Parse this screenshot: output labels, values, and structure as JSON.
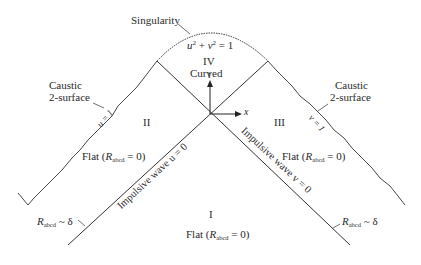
{
  "diagram": {
    "labels": {
      "singularity": "Singularity",
      "equation_u": "u",
      "equation_plus": " + ",
      "equation_v": "v",
      "equation_rest": " = 1",
      "region_iv": "IV",
      "region_iv_desc": "Curved",
      "axis_t": "t",
      "axis_x": "x",
      "caustic_left_1": "Caustic",
      "caustic_left_2": "2-surface",
      "caustic_right_1": "Caustic",
      "caustic_right_2": "2-surface",
      "u_eq_1": "u = 1",
      "v_eq_1": "v = 1",
      "region_ii": "II",
      "region_iii": "III",
      "region_i": "I",
      "flat_prefix": "Flat (",
      "flat_R": "R",
      "flat_sub": "abcd",
      "flat_suffix": " = 0)",
      "impulsive_u": "Impulsive wave u = 0",
      "impulsive_v": "Impulsive wave v = 0",
      "r_delta_R": "R",
      "r_delta_sub": "abcd",
      "r_delta_suffix": " ~ δ"
    },
    "colors": {
      "line": "#333333",
      "text": "#2a2a2a",
      "background": "#ffffff"
    }
  }
}
